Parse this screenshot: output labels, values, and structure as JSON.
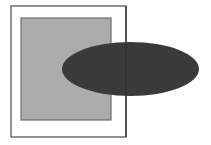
{
  "canvas": {
    "width": 211,
    "height": 145,
    "background_color": "#ffffff",
    "title": "Overlapping rectangle and ellipse figure"
  },
  "shapes": {
    "outer_frame": {
      "label": "outer-frame-rectangle",
      "x": 11,
      "y": 6,
      "width": 115,
      "height": 131,
      "fill": "none",
      "stroke": "#4a4a4a",
      "stroke_width": 1.2
    },
    "gray_rectangle": {
      "label": "gray-filled-rectangle",
      "x": 21,
      "y": 18,
      "width": 90,
      "height": 102,
      "fill": "#acacac",
      "stroke": "#6e6e6e",
      "stroke_width": 1.2
    },
    "dark_ellipse": {
      "label": "dark-filled-ellipse",
      "cx": 130.5,
      "cy": 69,
      "rx": 68.5,
      "ry": 27,
      "fill": "#3a3a3a",
      "stroke": "none",
      "stroke_width": 0
    },
    "frame_overlay_line": {
      "label": "frame-right-edge-over-ellipse",
      "x1": 126,
      "y1": 6,
      "x2": 126,
      "y2": 137,
      "stroke": "#2e2e2e",
      "stroke_width": 1.2
    }
  },
  "colors": {
    "background": "#ffffff",
    "gray_fill": "#acacac",
    "gray_stroke": "#6e6e6e",
    "dark_fill": "#3a3a3a",
    "frame_stroke": "#4a4a4a"
  }
}
